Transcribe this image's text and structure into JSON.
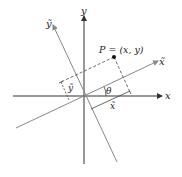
{
  "diagram": {
    "labels": {
      "x_axis": "x",
      "y_axis": "y",
      "x_tilde_axis": "x̃",
      "y_tilde_axis": "ỹ",
      "point": "P = (x, y)",
      "angle": "θ",
      "x_tilde_coord": "x̃",
      "y_tilde_coord": "ỹ"
    },
    "colors": {
      "axis": "#333333",
      "rotated_axis": "#888888",
      "dashed": "#444444",
      "point": "#111111"
    }
  }
}
